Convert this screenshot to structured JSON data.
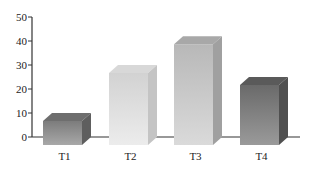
{
  "chart_data": {
    "type": "bar",
    "style": "3d-box",
    "title": "",
    "xlabel": "",
    "ylabel": "",
    "categories": [
      "T1",
      "T2",
      "T3",
      "T4"
    ],
    "values": [
      10,
      30,
      42,
      25
    ],
    "ylim": [
      0,
      50
    ],
    "yticks": [
      0,
      10,
      20,
      30,
      40,
      50
    ],
    "grid": false,
    "legend": null,
    "bar_colors": [
      {
        "front_light": "#a8a8a8",
        "front_dark": "#7c7c7c",
        "top": "#6e6e6e",
        "side": "#5e5e5e"
      },
      {
        "front_light": "#ececec",
        "front_dark": "#d2d2d2",
        "top": "#d8d8d8",
        "side": "#c4c4c4"
      },
      {
        "front_light": "#dadada",
        "front_dark": "#b8b8b8",
        "top": "#a8a8a8",
        "side": "#a0a0a0"
      },
      {
        "front_light": "#9a9a9a",
        "front_dark": "#6a6a6a",
        "top": "#5a5a5a",
        "side": "#505050"
      }
    ]
  }
}
